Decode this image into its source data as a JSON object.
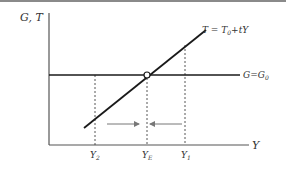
{
  "figure": {
    "y_axis_label": "G, T",
    "x_axis_label": "Y",
    "curves": [
      {
        "name": "tax-line",
        "label": "T = T₀+tY",
        "label_main": "T = T",
        "label_sub": "0",
        "label_tail": "+tY"
      },
      {
        "name": "government-line",
        "label": "G=G₀",
        "label_main": "G=G",
        "label_sub": "0"
      }
    ],
    "x_ticks": [
      {
        "label": "Y₂",
        "main": "Y",
        "sub": "2"
      },
      {
        "label": "Y_E",
        "main": "Y",
        "sub": "E"
      },
      {
        "label": "Y₁",
        "main": "Y",
        "sub": "1"
      }
    ],
    "equilibrium_marker": "open-circle",
    "arrows": [
      {
        "direction": "right",
        "from": "Y2",
        "to": "YE"
      },
      {
        "direction": "left",
        "from": "Y1",
        "to": "YE"
      }
    ],
    "colors": {
      "line": "#1a1a1a",
      "axis": "#555555",
      "dash": "#444444",
      "arrow": "#777777"
    }
  }
}
